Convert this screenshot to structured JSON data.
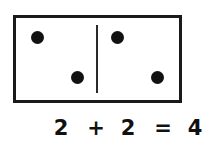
{
  "domino": {
    "left_half": {
      "pips": 2
    },
    "right_half": {
      "pips": 2
    }
  },
  "equation": {
    "operand_a": "2",
    "plus": "+",
    "operand_b": "2",
    "equals": "=",
    "result": "4"
  },
  "colors": {
    "ink": "#111111",
    "background": "#ffffff"
  }
}
